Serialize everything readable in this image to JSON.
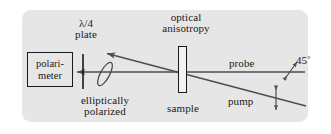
{
  "figure": {
    "canvas": {
      "width": 331,
      "height": 134
    },
    "panel": {
      "background_color": "#e6e6e6",
      "corner_radius": 9
    },
    "line_color": "#4d4d4d",
    "ink_color": "#1a1a1a"
  },
  "labels": {
    "quarter_wave_plate_line1": "λ/4",
    "quarter_wave_plate_line2": "plate",
    "optical_anisotropy_line1": "optical",
    "optical_anisotropy_line2": "anisotropy",
    "probe": "probe",
    "angle_value": "45",
    "angle_degree_symbol": "°",
    "pump": "pump",
    "elliptically_line1": "elliptically",
    "elliptically_line2": "polarized",
    "sample": "sample",
    "polarimeter_line1": "polari-",
    "polarimeter_line2": "meter"
  },
  "components": {
    "polarimeter": {
      "name": "polarimeter",
      "x": 27,
      "y": 52,
      "width": 46,
      "height": 35
    },
    "quarter_wave_plate": {
      "name": "quarter-wave-plate",
      "x": 83,
      "y_top": 54,
      "y_bottom": 89
    },
    "polarization_ellipse": {
      "name": "elliptical-polarization-state",
      "cx": 105,
      "cy": 74,
      "rx": 4.5,
      "ry": 13,
      "tilt_deg": 28
    },
    "sample": {
      "name": "sample-slab",
      "x": 178,
      "y": 46,
      "width": 9,
      "height": 47
    }
  },
  "beams": {
    "probe_beam": {
      "name": "probe-beam",
      "direction": "right-to-left",
      "from": [
        305,
        72
      ],
      "to": [
        76,
        72
      ],
      "arrow_at": "left-end"
    },
    "pump_beam": {
      "name": "pump-beam",
      "direction": "lower-right-to-upper-left",
      "from": [
        305,
        105
      ],
      "to": [
        106,
        53
      ],
      "arrow_at": "upper-left-end"
    }
  },
  "polarization_markers": {
    "probe_polarization": {
      "name": "45-degree-polarization-marker",
      "orientation": "diagonal-45",
      "label": "45°"
    },
    "pump_polarization": {
      "name": "vertical-polarization-marker",
      "orientation": "vertical"
    }
  }
}
